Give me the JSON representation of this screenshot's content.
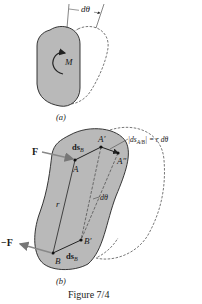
{
  "figure": {
    "caption": "Figure 7/4",
    "colors": {
      "body_fill": "#b9b9b9",
      "outline": "#222222",
      "dashed": "#555555",
      "force_arrow": "#8a8a8a"
    },
    "part_a": {
      "sublabel": "(a)",
      "angle_label": "dθ",
      "moment_label": "M"
    },
    "part_b": {
      "sublabel": "(b)",
      "force_top": "F",
      "force_bottom": "−F",
      "point_A": "A",
      "point_A_prime": "A′",
      "point_A_double_prime": "A″",
      "point_B": "B",
      "point_B_prime": "B′",
      "radius_label": "r",
      "angle_label": "dθ",
      "ds_B_top": "ds",
      "ds_B_top_sub": "B",
      "ds_B_bottom": "ds",
      "ds_B_bottom_sub": "B",
      "relative_disp_label": "|ds",
      "relative_disp_sub": "A/B",
      "relative_disp_rhs": "| = r dθ"
    }
  }
}
